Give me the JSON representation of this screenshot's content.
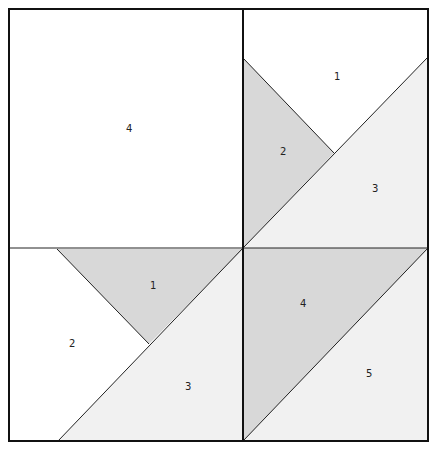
{
  "colors": {
    "white": "#ffffff",
    "light": "#f1f1f1",
    "gray": "#d8d8d8",
    "line": "#111111"
  },
  "blocks": {
    "top_left": {
      "labels": [
        {
          "text": "4",
          "x": 126,
          "y": 132
        }
      ]
    },
    "top_right": {
      "labels": [
        {
          "text": "1",
          "x": 334,
          "y": 80
        },
        {
          "text": "2",
          "x": 280,
          "y": 155
        },
        {
          "text": "3",
          "x": 372,
          "y": 192
        }
      ]
    },
    "bottom_left": {
      "labels": [
        {
          "text": "1",
          "x": 150,
          "y": 289
        },
        {
          "text": "2",
          "x": 69,
          "y": 347
        },
        {
          "text": "3",
          "x": 185,
          "y": 390
        }
      ]
    },
    "bottom_right": {
      "labels": [
        {
          "text": "4",
          "x": 300,
          "y": 307
        },
        {
          "text": "5",
          "x": 366,
          "y": 377
        }
      ]
    }
  }
}
